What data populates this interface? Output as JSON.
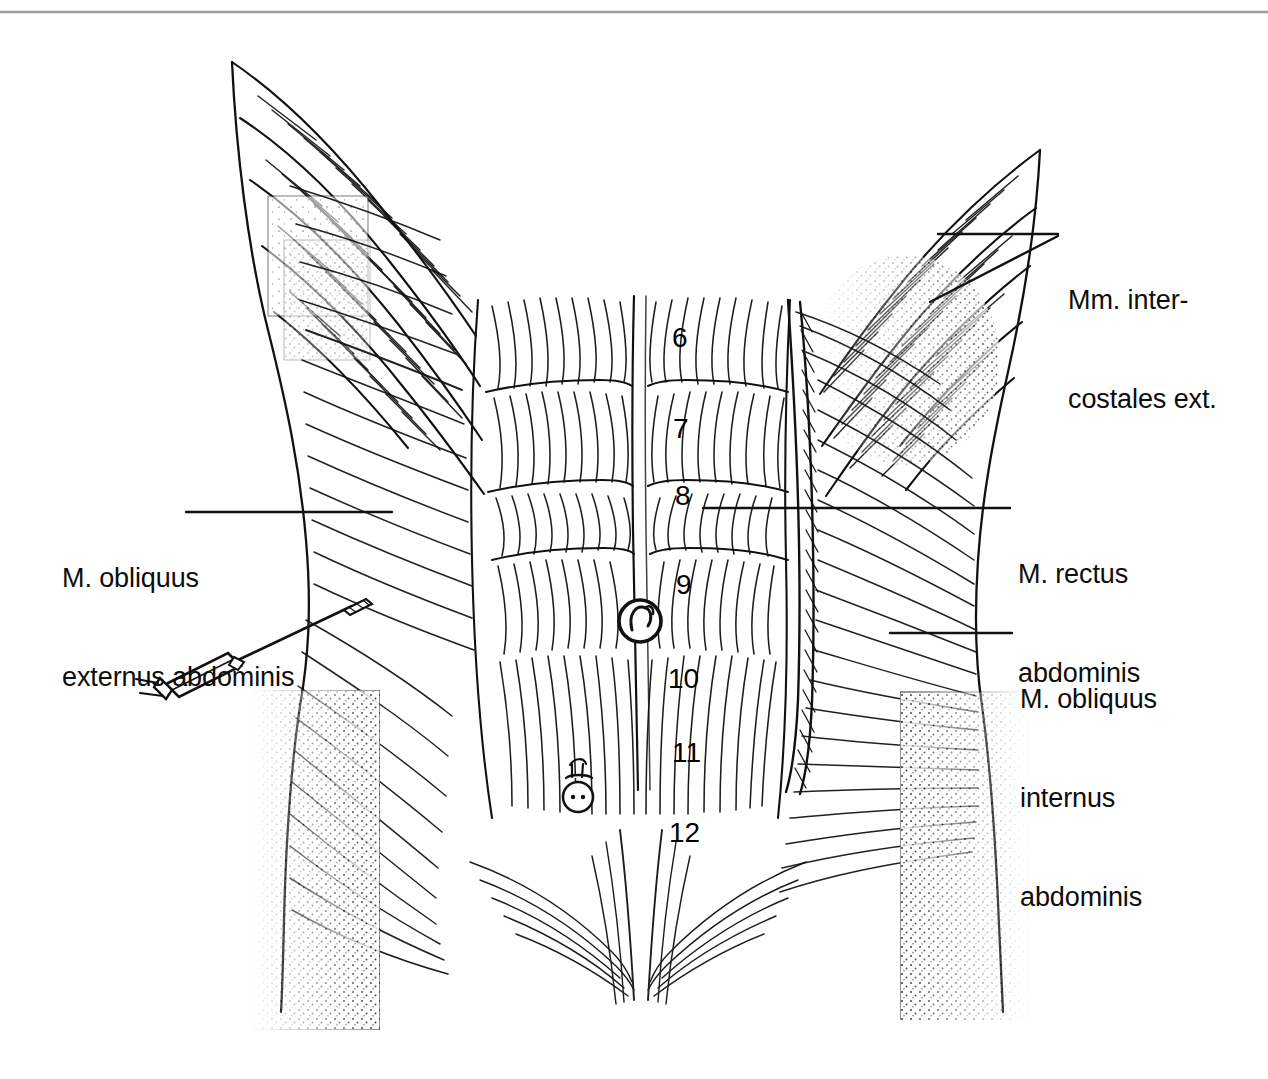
{
  "figure": {
    "kind": "anatomical-line-drawing",
    "background_color": "#ffffff",
    "ink_color": "#111111",
    "top_rule_color": "#9a9a9a"
  },
  "labels": {
    "intercostales": {
      "lines": [
        "Mm. inter-",
        "costales ext."
      ],
      "line1": "Mm. inter-",
      "line2": "costales ext."
    },
    "rectus": {
      "lines": [
        "M. rectus",
        "abdominis"
      ],
      "line1": "M. rectus",
      "line2": "abdominis"
    },
    "obliquus_internus": {
      "lines": [
        "M. obliquus",
        "internus",
        "abdominis"
      ],
      "line1": "M. obliquus",
      "line2": "internus",
      "line3": "abdominis"
    },
    "obliquus_externus": {
      "lines": [
        "M. obliquus",
        "externus abdominis"
      ],
      "line1": "M. obliquus",
      "line2": "externus abdominis"
    }
  },
  "rib_numbers": [
    {
      "value": "6",
      "x": 672,
      "y": 324
    },
    {
      "value": "7",
      "x": 673,
      "y": 415
    },
    {
      "value": "8",
      "x": 675,
      "y": 482
    },
    {
      "value": "9",
      "x": 676,
      "y": 571
    },
    {
      "value": "10",
      "x": 668,
      "y": 665
    },
    {
      "value": "11",
      "x": 672,
      "y": 739
    },
    {
      "value": "12",
      "x": 669,
      "y": 819
    }
  ],
  "markers": {
    "umbilicus": {
      "name": "umbilicus",
      "cx": 640,
      "cy": 621,
      "r": 21
    },
    "vessel_stub": {
      "name": "cut-vessel-stub",
      "cx": 578,
      "cy": 795,
      "r": 15
    },
    "syringe": {
      "name": "syringe-with-needle",
      "needle_tip_x": 358,
      "needle_tip_y": 601,
      "barrel_x": 186,
      "barrel_y": 673
    }
  }
}
